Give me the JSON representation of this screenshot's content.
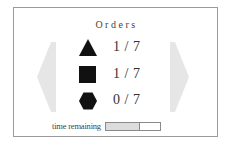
{
  "panel": {
    "title": "Orders"
  },
  "navigation": {
    "previous_icon": "chevron-left-icon",
    "next_icon": "chevron-right-icon",
    "arrow_color": "#e6e6e6"
  },
  "orders": [
    {
      "shape": "triangle",
      "icon": "triangle-icon",
      "fulfilled": 1,
      "required": 7,
      "text": "1 / 7"
    },
    {
      "shape": "square",
      "icon": "square-icon",
      "fulfilled": 1,
      "required": 7,
      "text": "1 / 7"
    },
    {
      "shape": "hexagon",
      "icon": "hexagon-icon",
      "fulfilled": 0,
      "required": 7,
      "text": "0 / 7"
    }
  ],
  "timer": {
    "label": "time remaining",
    "progress_percent": 63,
    "fill_color": "#dcdcdc"
  },
  "colors": {
    "shape_fill": "#111111",
    "border": "#9a9a9a",
    "text": "#333333"
  }
}
